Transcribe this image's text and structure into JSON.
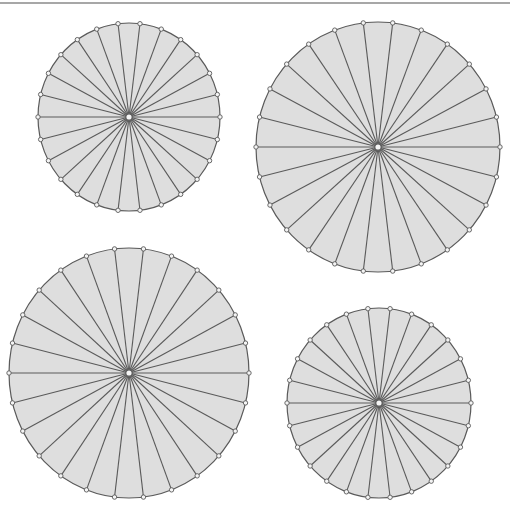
{
  "canvas": {
    "width": 515,
    "height": 511,
    "background": "#ffffff"
  },
  "top_rule": {
    "x1": 0,
    "x2": 510,
    "y": 3,
    "color": "#8a8a8a",
    "width": 1.5
  },
  "style": {
    "disc_fill": "#dedede",
    "stroke": "#5a5a5a",
    "spoke_width": 1.1,
    "rim_width": 1.2,
    "vertex_marker_radius": 2.2,
    "vertex_marker_fill": "#f4f4f4",
    "center_marker_radius": 3.2,
    "center_marker_fill": "#f4f4f4"
  },
  "diagrams": [
    {
      "name": "wheel-top-left",
      "spokes": 26,
      "cx": 129,
      "cy": 117,
      "rx": 91,
      "ry": 94,
      "start_angle_deg": 0
    },
    {
      "name": "wheel-top-right",
      "spokes": 26,
      "cx": 378,
      "cy": 147,
      "rx": 122,
      "ry": 125,
      "start_angle_deg": 0
    },
    {
      "name": "wheel-bottom-left",
      "spokes": 26,
      "cx": 129,
      "cy": 373,
      "rx": 120,
      "ry": 125,
      "start_angle_deg": 0
    },
    {
      "name": "wheel-bottom-right",
      "spokes": 26,
      "cx": 379,
      "cy": 403,
      "rx": 92,
      "ry": 95,
      "start_angle_deg": 0
    }
  ]
}
